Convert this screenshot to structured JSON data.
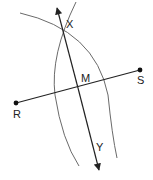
{
  "diagram": {
    "points": {
      "R": {
        "label": "R",
        "x": 16,
        "y": 103
      },
      "S": {
        "label": "S",
        "x": 140,
        "y": 70
      },
      "M": {
        "label": "M"
      },
      "X": {
        "label": "X"
      },
      "Y": {
        "label": "Y"
      }
    },
    "colors": {
      "line": "#222222",
      "arc": "#6a6a6a",
      "point": "#111111"
    }
  }
}
